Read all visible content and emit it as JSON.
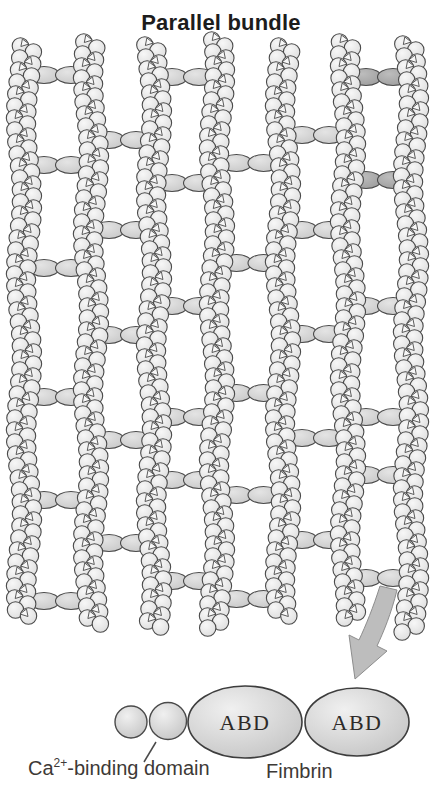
{
  "title": "Parallel bundle",
  "labels": {
    "ca_prefix": "Ca",
    "ca_sup": "2+",
    "ca_suffix": "-binding domain",
    "fimbrin": "Fimbrin",
    "abd": "ABD"
  },
  "colors": {
    "background": "#ffffff",
    "outline": "#4a4a4a",
    "bead_light": "#f7f7f7",
    "bead_base": "#dedede",
    "link_light": "#e4e4e4",
    "link_base": "#c9c9c9",
    "link_dark_light": "#bdbdbd",
    "link_dark_base": "#9e9e9e",
    "domain_light": "#f0f0f0",
    "domain_base": "#c6c6c6",
    "arrow_fill": "#bdbdbd",
    "arrow_edge": "#8d8d8d",
    "text": "#3d3936",
    "title_text": "#1c1c1c"
  },
  "bundle": {
    "filaments": [
      {
        "x": 24,
        "top": 46,
        "bottom": 620
      },
      {
        "x": 91,
        "top": 42,
        "bottom": 625
      },
      {
        "x": 154,
        "top": 45,
        "bottom": 628
      },
      {
        "x": 217,
        "top": 40,
        "bottom": 628
      },
      {
        "x": 283,
        "top": 46,
        "bottom": 620
      },
      {
        "x": 348,
        "top": 42,
        "bottom": 622
      },
      {
        "x": 411,
        "top": 44,
        "bottom": 632
      }
    ],
    "crosslinks": [
      {
        "pair": 0,
        "y": 75,
        "dark": false
      },
      {
        "pair": 0,
        "y": 165,
        "dark": false
      },
      {
        "pair": 0,
        "y": 268,
        "dark": false
      },
      {
        "pair": 0,
        "y": 397,
        "dark": false
      },
      {
        "pair": 0,
        "y": 500,
        "dark": false
      },
      {
        "pair": 0,
        "y": 601,
        "dark": false
      },
      {
        "pair": 1,
        "y": 140,
        "dark": false
      },
      {
        "pair": 1,
        "y": 230,
        "dark": false
      },
      {
        "pair": 1,
        "y": 335,
        "dark": false
      },
      {
        "pair": 1,
        "y": 440,
        "dark": false
      },
      {
        "pair": 1,
        "y": 543,
        "dark": false
      },
      {
        "pair": 2,
        "y": 77,
        "dark": false
      },
      {
        "pair": 2,
        "y": 183,
        "dark": false
      },
      {
        "pair": 2,
        "y": 306,
        "dark": false
      },
      {
        "pair": 2,
        "y": 417,
        "dark": false
      },
      {
        "pair": 2,
        "y": 480,
        "dark": false
      },
      {
        "pair": 2,
        "y": 581,
        "dark": false
      },
      {
        "pair": 3,
        "y": 163,
        "dark": false
      },
      {
        "pair": 3,
        "y": 263,
        "dark": false
      },
      {
        "pair": 3,
        "y": 393,
        "dark": false
      },
      {
        "pair": 3,
        "y": 495,
        "dark": false
      },
      {
        "pair": 3,
        "y": 599,
        "dark": false
      },
      {
        "pair": 4,
        "y": 135,
        "dark": false
      },
      {
        "pair": 4,
        "y": 230,
        "dark": false
      },
      {
        "pair": 4,
        "y": 334,
        "dark": false
      },
      {
        "pair": 4,
        "y": 438,
        "dark": false
      },
      {
        "pair": 4,
        "y": 540,
        "dark": false
      },
      {
        "pair": 5,
        "y": 77,
        "dark": true
      },
      {
        "pair": 5,
        "y": 180,
        "dark": true
      },
      {
        "pair": 5,
        "y": 306,
        "dark": false
      },
      {
        "pair": 5,
        "y": 417,
        "dark": false
      },
      {
        "pair": 5,
        "y": 475,
        "dark": false
      },
      {
        "pair": 5,
        "y": 578,
        "dark": false
      }
    ]
  },
  "molecule": {
    "domains": [
      {
        "type": "circle",
        "cx": 131,
        "cy": 722,
        "r": 16,
        "label": ""
      },
      {
        "type": "circle",
        "cx": 168,
        "cy": 721,
        "r": 18.5,
        "label": ""
      },
      {
        "type": "ellipse",
        "cx": 245,
        "cy": 722,
        "rx": 57,
        "ry": 36,
        "label": "ABD"
      },
      {
        "type": "ellipse",
        "cx": 357,
        "cy": 722,
        "rx": 52,
        "ry": 34,
        "label": "ABD"
      }
    ],
    "leader_line": {
      "x1": 156,
      "y1": 742,
      "x2": 144,
      "y2": 762
    },
    "arrow": {
      "tail_x": 388,
      "tail_y": 587,
      "tip_x": 355,
      "tip_y": 679
    }
  }
}
